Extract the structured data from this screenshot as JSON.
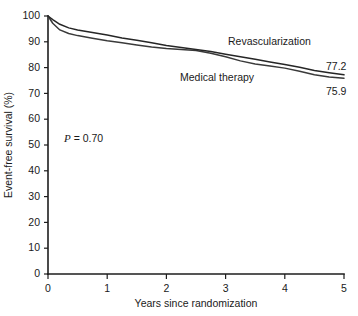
{
  "chart_data": {
    "type": "line",
    "title": "",
    "xlabel": "Years since randomization",
    "ylabel": "Event-free survival (%)",
    "xlim": [
      0,
      5
    ],
    "ylim": [
      0,
      100
    ],
    "xticks": [
      "0",
      "1",
      "2",
      "3",
      "4",
      "5"
    ],
    "yticks": [
      "0",
      "10",
      "20",
      "30",
      "40",
      "50",
      "60",
      "70",
      "80",
      "90",
      "100"
    ],
    "grid": false,
    "legend_position": "inline-curve-labels",
    "annotations": [
      {
        "name": "p-value",
        "text_italic": "P",
        "text_rest": " = 0.70",
        "full_text": "P = 0.70"
      }
    ],
    "series": [
      {
        "name": "Revascularization",
        "label": "Revascularization",
        "endpoint_value": "77.2",
        "color": "#262626",
        "x": [
          0,
          0.08,
          0.2,
          0.35,
          0.5,
          0.75,
          1.0,
          1.25,
          1.5,
          1.75,
          2.0,
          2.25,
          2.5,
          2.75,
          3.0,
          3.25,
          3.5,
          3.75,
          4.0,
          4.25,
          4.5,
          4.75,
          5.0
        ],
        "y": [
          100,
          98.6,
          96.8,
          95.4,
          94.6,
          93.6,
          92.6,
          91.5,
          90.6,
          89.6,
          88.6,
          87.8,
          87.0,
          86.2,
          85.2,
          84.2,
          83.2,
          82.2,
          81.2,
          80.1,
          78.9,
          78.0,
          77.2
        ]
      },
      {
        "name": "Medical therapy",
        "label": "Medical therapy",
        "endpoint_value": "75.9",
        "color": "#3a3a3a",
        "x": [
          0,
          0.08,
          0.2,
          0.35,
          0.5,
          0.75,
          1.0,
          1.25,
          1.5,
          1.75,
          2.0,
          2.25,
          2.5,
          2.75,
          3.0,
          3.25,
          3.5,
          3.75,
          4.0,
          4.25,
          4.5,
          4.75,
          5.0
        ],
        "y": [
          100,
          97.2,
          94.6,
          93.2,
          92.4,
          91.4,
          90.4,
          89.6,
          88.8,
          88.0,
          87.4,
          87.0,
          86.6,
          85.6,
          84.2,
          82.6,
          81.4,
          80.6,
          79.8,
          78.6,
          77.2,
          76.4,
          75.9
        ]
      }
    ]
  },
  "labels": {
    "series_a_label": "Revascularization",
    "series_b_label": "Medical therapy",
    "series_a_endpoint": "77.2",
    "series_b_endpoint": "75.9",
    "p_value_italic": "P",
    "p_value_rest": " = 0.70",
    "x_axis_title": "Years since randomization",
    "y_axis_title": "Event-free survival (%)"
  }
}
